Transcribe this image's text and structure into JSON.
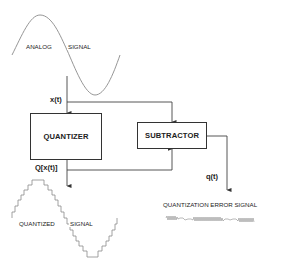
{
  "diagram": {
    "analog_signal": {
      "label_left": "ANALOG",
      "label_right": "SIGNAL"
    },
    "quantizer": {
      "label": "QUANTIZER"
    },
    "subtractor": {
      "label": "SUBTRACTOR"
    },
    "variables": {
      "input": "x(t)",
      "quantized": "Q[x(t)]",
      "error": "q(t)"
    },
    "quantized_signal": {
      "label_left": "QUANTIZED",
      "label_right": "SIGNAL"
    },
    "error_signal": {
      "label": "QUANTIZATION ERROR SIGNAL"
    },
    "colors": {
      "line": "#444444",
      "curve": "#888888",
      "box_border": "#333333",
      "text": "#222222"
    }
  }
}
